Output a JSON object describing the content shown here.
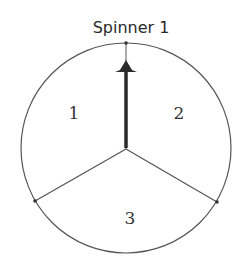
{
  "title": "Spinner 1",
  "spinner": {
    "sections": [
      {
        "label": "1",
        "position": "upper-left"
      },
      {
        "label": "2",
        "position": "upper-right"
      },
      {
        "label": "3",
        "position": "bottom"
      }
    ],
    "pointer": {
      "direction": "up",
      "icon": "arrow-up-icon"
    }
  },
  "colors": {
    "stroke": "#555555",
    "pointer": "#2a2a2a",
    "background": "#ffffff"
  }
}
